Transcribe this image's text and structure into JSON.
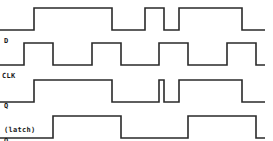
{
  "diagram": {
    "type": "timing-diagram",
    "signals": [
      {
        "id": "d",
        "label_lines": [
          "D"
        ],
        "label_pos": [
          4,
          21
        ],
        "high_y": 8,
        "low_y": 30,
        "x_start": 0,
        "x_end": 265,
        "initial": 0,
        "transitions": [
          34,
          112,
          145,
          164,
          179,
          242
        ]
      },
      {
        "id": "clk",
        "label_lines": [
          "CLK"
        ],
        "label_pos": [
          2,
          56
        ],
        "high_y": 43,
        "low_y": 65,
        "x_start": 0,
        "x_end": 265,
        "initial": 0,
        "transitions": [
          24,
          53,
          92,
          121,
          159,
          188,
          227,
          256
        ]
      },
      {
        "id": "q-latch",
        "label_lines": [
          "Q",
          "(latch)"
        ],
        "label_pos": [
          4,
          86
        ],
        "high_y": 80,
        "low_y": 102,
        "x_start": 0,
        "x_end": 265,
        "initial": 0,
        "transitions": [
          34,
          112,
          159,
          164,
          179,
          242
        ]
      },
      {
        "id": "q-ff",
        "label_lines": [
          "Q",
          "(FF)"
        ],
        "label_pos": [
          4,
          121
        ],
        "high_y": 116,
        "low_y": 138,
        "x_start": 0,
        "x_end": 265,
        "initial": 0,
        "transitions": [
          53,
          121,
          188,
          256
        ]
      }
    ],
    "colors": {
      "line": "#2a2a2a",
      "background": "#ffffff"
    }
  }
}
